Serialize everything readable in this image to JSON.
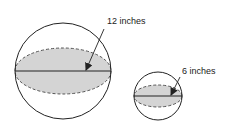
{
  "diagram": {
    "type": "spheres-with-radius",
    "colors": {
      "stroke": "#222222",
      "fill": "#d4d4d4",
      "background": "#ffffff"
    },
    "spheres": [
      {
        "name": "large-sphere",
        "label": "12 inches",
        "cx": 63,
        "cy": 71,
        "r": 48,
        "ellipse_ry": 23,
        "label_x": 107,
        "label_y": 24,
        "arrow_from": [
          104,
          29
        ],
        "arrow_to": [
          85,
          70
        ]
      },
      {
        "name": "small-sphere",
        "label": "6 inches",
        "cx": 158,
        "cy": 96,
        "r": 24,
        "ellipse_ry": 11,
        "label_x": 182,
        "label_y": 74,
        "arrow_from": [
          180,
          77
        ],
        "arrow_to": [
          171,
          95
        ]
      }
    ]
  }
}
